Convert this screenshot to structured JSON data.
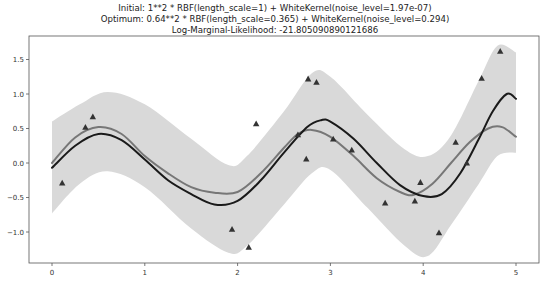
{
  "chart_data": {
    "type": "line",
    "title_lines": [
      "Initial: 1**2 * RBF(length_scale=1) + WhiteKernel(noise_level=1.97e-07)",
      "Optimum: 0.64**2 * RBF(length_scale=0.365) + WhiteKernel(noise_level=0.294)",
      "Log-Marginal-Likelihood: -21.805090890121686"
    ],
    "xlabel": "",
    "ylabel": "",
    "xlim": [
      -0.25,
      5.25
    ],
    "ylim": [
      -1.45,
      1.85
    ],
    "xticks": [
      0,
      1,
      2,
      3,
      4,
      5
    ],
    "xtick_labels": [
      "0",
      "1",
      "2",
      "3",
      "4",
      "5"
    ],
    "yticks": [
      -1.0,
      -0.5,
      0.0,
      0.5,
      1.0,
      1.5
    ],
    "ytick_labels": [
      "−1.0",
      "−0.5",
      "0.0",
      "0.5",
      "1.0",
      "1.5"
    ],
    "grid": false,
    "legend": null,
    "colors": {
      "mean": "#1a1a1a",
      "true_function": "#777777",
      "band": "#d9d9d9",
      "points": "#333333"
    },
    "band": {
      "name": "confidence interval",
      "x": [
        0,
        0.3,
        0.6,
        1.0,
        1.5,
        1.9,
        2.1,
        2.5,
        2.8,
        3.0,
        3.4,
        3.8,
        4.05,
        4.3,
        4.6,
        4.8,
        5.0
      ],
      "upper": [
        0.6,
        0.85,
        1.03,
        0.85,
        0.35,
        -0.03,
        0.1,
        0.75,
        1.3,
        1.25,
        0.7,
        0.2,
        0.1,
        0.4,
        1.2,
        1.7,
        1.6
      ],
      "lower": [
        -0.73,
        -0.3,
        -0.12,
        -0.35,
        -0.95,
        -1.3,
        -1.2,
        -0.6,
        -0.15,
        -0.1,
        -0.65,
        -1.2,
        -1.35,
        -0.9,
        -0.3,
        0.1,
        0.15
      ]
    },
    "series": [
      {
        "name": "GP predictive mean",
        "x": [
          0,
          0.25,
          0.5,
          0.75,
          1.0,
          1.25,
          1.5,
          1.75,
          2.0,
          2.25,
          2.5,
          2.75,
          2.9,
          3.0,
          3.25,
          3.5,
          3.75,
          4.0,
          4.2,
          4.4,
          4.6,
          4.75,
          4.9,
          5.0
        ],
        "y": [
          -0.07,
          0.25,
          0.42,
          0.33,
          0.05,
          -0.25,
          -0.45,
          -0.6,
          -0.55,
          -0.25,
          0.15,
          0.52,
          0.62,
          0.6,
          0.35,
          0.0,
          -0.32,
          -0.48,
          -0.45,
          -0.15,
          0.35,
          0.75,
          1.0,
          0.93
        ]
      },
      {
        "name": "underlying function",
        "x": [
          0,
          0.25,
          0.5,
          0.75,
          1.0,
          1.25,
          1.5,
          1.75,
          2.0,
          2.25,
          2.5,
          2.65,
          2.8,
          3.0,
          3.25,
          3.5,
          3.75,
          3.9,
          4.1,
          4.3,
          4.5,
          4.7,
          4.85,
          5.0
        ],
        "y": [
          0.0,
          0.37,
          0.52,
          0.42,
          0.1,
          -0.15,
          -0.35,
          -0.43,
          -0.42,
          -0.15,
          0.22,
          0.42,
          0.48,
          0.38,
          0.1,
          -0.22,
          -0.42,
          -0.46,
          -0.3,
          0.0,
          0.3,
          0.5,
          0.52,
          0.38
        ]
      }
    ],
    "scatter": {
      "name": "observations",
      "marker": "triangle",
      "x": [
        0.11,
        0.36,
        0.44,
        1.94,
        2.2,
        2.12,
        2.65,
        2.76,
        2.85,
        2.74,
        3.03,
        3.23,
        3.59,
        3.91,
        3.97,
        4.17,
        4.35,
        4.47,
        4.63,
        4.83
      ],
      "y": [
        -0.29,
        0.52,
        0.67,
        -0.96,
        0.57,
        -1.22,
        0.41,
        1.22,
        1.17,
        0.06,
        0.35,
        0.19,
        -0.58,
        -0.55,
        -0.28,
        -1.01,
        0.3,
        0.0,
        1.23,
        1.62
      ]
    }
  }
}
